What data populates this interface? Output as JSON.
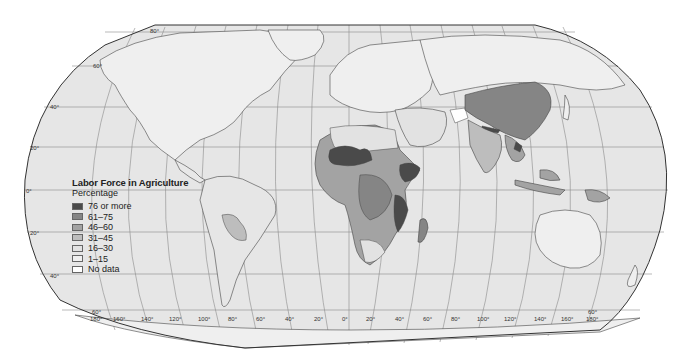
{
  "map": {
    "title": "Labor Force in Agriculture",
    "subtitle": "Percentage",
    "projection_style": "Robinson-like world map",
    "colors": {
      "ocean": "#e6e6e6",
      "no_data": "#ffffff",
      "c1_15": "#ededed",
      "c16_30": "#e2e2e2",
      "c31_45": "#bdbdbd",
      "c46_60": "#a3a3a3",
      "c61_75": "#858585",
      "c76_plus": "#4a4a4a"
    },
    "legend": [
      {
        "label": "76 or more",
        "color": "#4a4a4a"
      },
      {
        "label": "61–75",
        "color": "#858585"
      },
      {
        "label": "46–60",
        "color": "#a3a3a3"
      },
      {
        "label": "31–45",
        "color": "#bdbdbd"
      },
      {
        "label": "16–30",
        "color": "#e2e2e2"
      },
      {
        "label": "1–15",
        "color": "#f0f0f0"
      },
      {
        "label": "No data",
        "color": "#ffffff"
      }
    ],
    "latitude_labels_left": [
      "80°",
      "60°",
      "40°",
      "20°",
      "0°",
      "20°",
      "40°",
      "60°"
    ],
    "latitude_labels_right": [
      "60°"
    ],
    "longitude_labels": [
      "180°",
      "160°",
      "140°",
      "120°",
      "100°",
      "80°",
      "60°",
      "40°",
      "20°",
      "0°",
      "20°",
      "40°",
      "60°",
      "80°",
      "100°",
      "120°",
      "140°",
      "160°",
      "180°"
    ],
    "regions": [
      {
        "name": "Africa (Sahel, Ethiopia, East Africa)",
        "class": "76 or more"
      },
      {
        "name": "Central/Eastern Africa",
        "class": "61–75"
      },
      {
        "name": "China",
        "class": "61–75"
      },
      {
        "name": "Nepal / Laos",
        "class": "76 or more"
      },
      {
        "name": "India",
        "class": "46–60"
      },
      {
        "name": "Southeast Asia / Indonesia / Papua New Guinea",
        "class": "46–60"
      },
      {
        "name": "Bolivia / Paraguay",
        "class": "31–45"
      },
      {
        "name": "Afghanistan",
        "class": "No data"
      },
      {
        "name": "North America / Europe / Russia / Australia",
        "class": "1–15"
      }
    ]
  }
}
